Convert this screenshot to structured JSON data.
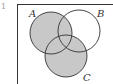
{
  "diagram": {
    "type": "venn",
    "sets": [
      {
        "label": "A",
        "cx": 51,
        "cy": 33,
        "r": 21
      },
      {
        "label": "B",
        "cx": 79,
        "cy": 31,
        "r": 21
      },
      {
        "label": "C",
        "cx": 66,
        "cy": 56,
        "r": 21
      }
    ],
    "shaded_region": "A ∪ C",
    "shade_color": "#c8c8c8",
    "stroke_color": "#333333",
    "corner_mark": "1"
  }
}
